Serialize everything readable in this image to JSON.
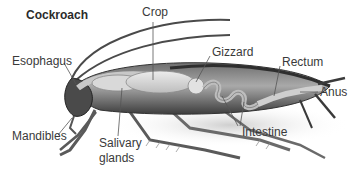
{
  "diagram": {
    "title": "Cockroach",
    "labels": {
      "crop": "Crop",
      "gizzard": "Gizzard",
      "rectum": "Rectum",
      "anus": "Anus",
      "esophagus": "Esophagus",
      "mandibles": "Mandibles",
      "salivary_line1": "Salivary",
      "salivary_line2": "glands",
      "intestine": "Intestine"
    },
    "colors": {
      "body_dark": "#3c3c3c",
      "body_mid": "#8a8a8a",
      "organ_light": "#d8d8d8",
      "leader_line": "#555555",
      "background": "#ffffff"
    }
  }
}
